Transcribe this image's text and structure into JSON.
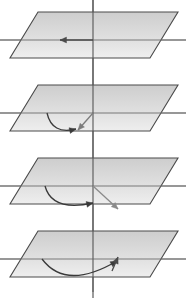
{
  "figure": {
    "title": "Rotation of a vector in a plane — four-stage sequence",
    "width": 186,
    "height": 298,
    "background_color": "#ffffff"
  },
  "style": {
    "plane_fill_top": "#c9c9c9",
    "plane_fill_bottom": "#ededed",
    "plane_stroke": "#4a4a4a",
    "axis_color": "#6e6e6e",
    "vertical_axis_color": "#5a5a5a",
    "arrow_color": "#3a3a3a",
    "arrow_color_light": "#8a8a8a",
    "plane_stroke_width": 1.1,
    "axis_stroke_width": 1.2,
    "arrow_stroke_width": 1.3
  },
  "geometry": {
    "panel_count": 4,
    "panel_spacing": 73,
    "plane_top_y": 12,
    "plane_bottom_y": 58,
    "plane_top_left_x": 38,
    "plane_top_right_x": 178,
    "plane_bottom_left_x": 10,
    "plane_bottom_right_x": 150,
    "horizontal_axis_y": 40,
    "horizontal_axis_x1": 0,
    "horizontal_axis_x2": 186,
    "vertical_axis_x": 93,
    "vertical_axis_y1": 0,
    "vertical_axis_y2": 298
  },
  "panels": [
    {
      "index": 1,
      "name": "panel-stage-1",
      "offset_y": 0,
      "label": "Stage 1 — vector pointing left along the horizontal axis",
      "elements": [
        {
          "name": "straight-arrow-left",
          "type": "arrow",
          "from_x": 93,
          "from_y": 40,
          "to_x": 60,
          "to_y": 40,
          "direction": "left",
          "color": "#4a4a4a"
        }
      ]
    },
    {
      "index": 2,
      "name": "panel-stage-2",
      "offset_y": 73,
      "label": "Stage 2 — vector rotated down-right, curved rotation arc shown",
      "elements": [
        {
          "name": "rotation-arc",
          "type": "curve",
          "from_x": 47,
          "from_y": 40,
          "ctrl_x": 52,
          "ctrl_y": 62,
          "to_x": 76,
          "to_y": 56,
          "direction": "down-right",
          "color": "#3a3a3a"
        },
        {
          "name": "vector-arrow-down-right",
          "type": "arrow",
          "from_x": 93,
          "from_y": 40,
          "to_x": 78,
          "to_y": 57,
          "direction": "down-left",
          "color": "#7c7c7c"
        }
      ]
    },
    {
      "index": 3,
      "name": "panel-stage-3",
      "offset_y": 146,
      "label": "Stage 3 — vector rotated further, arc sweeps toward the centre",
      "elements": [
        {
          "name": "rotation-arc",
          "type": "curve",
          "from_x": 45,
          "from_y": 40,
          "ctrl_x": 52,
          "ctrl_y": 66,
          "to_x": 93,
          "to_y": 57,
          "direction": "right",
          "color": "#3a3a3a"
        },
        {
          "name": "vector-arrow-down-right",
          "type": "arrow",
          "from_x": 93,
          "from_y": 40,
          "to_x": 118,
          "to_y": 63,
          "direction": "down-right",
          "color": "#8a8a8a"
        }
      ]
    },
    {
      "index": 4,
      "name": "panel-stage-4",
      "offset_y": 219,
      "label": "Stage 4 — full sweep, vector returns pointing up-right at the axis",
      "elements": [
        {
          "name": "rotation-arc",
          "type": "curve",
          "from_x": 42,
          "from_y": 40,
          "ctrl_x": 66,
          "ctrl_y": 72,
          "to_x": 117,
          "to_y": 42,
          "direction": "up-right",
          "color": "#3a3a3a"
        },
        {
          "name": "vector-arrow-up",
          "type": "arrow",
          "from_x": 112,
          "from_y": 52,
          "to_x": 118,
          "to_y": 38,
          "direction": "up",
          "color": "#4a4a4a"
        }
      ]
    }
  ]
}
